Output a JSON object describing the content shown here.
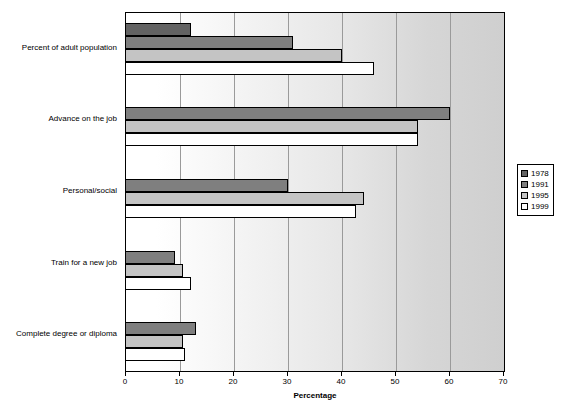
{
  "chart_data": {
    "type": "bar",
    "orientation": "horizontal",
    "title": "",
    "xlabel": "Percentage",
    "ylabel": "",
    "xlim": [
      0,
      70
    ],
    "xticks": [
      0,
      10,
      20,
      30,
      40,
      50,
      60,
      70
    ],
    "grid": true,
    "legend_position": "right",
    "categories": [
      "Percent of adult population",
      "Advance on the job",
      "Personal/social",
      "Train for a new job",
      "Complete degree or diploma"
    ],
    "series": [
      {
        "name": "1978",
        "color": "#636363",
        "values": [
          12,
          0,
          0,
          0,
          0
        ]
      },
      {
        "name": "1991",
        "color": "#7f7f7f",
        "values": [
          31,
          60,
          30,
          9,
          13
        ]
      },
      {
        "name": "1995",
        "color": "#c4c4c4",
        "values": [
          40,
          54,
          44,
          10.5,
          10.5
        ]
      },
      {
        "name": "1999",
        "color": "#ffffff",
        "values": [
          46,
          54,
          42.5,
          12,
          11
        ]
      }
    ]
  },
  "legend": {
    "items": [
      {
        "label": "1978"
      },
      {
        "label": "1991"
      },
      {
        "label": "1995"
      },
      {
        "label": "1999"
      }
    ]
  },
  "axis": {
    "x_title": "Percentage",
    "tick_labels": [
      "0",
      "10",
      "20",
      "30",
      "40",
      "50",
      "60",
      "70"
    ]
  }
}
